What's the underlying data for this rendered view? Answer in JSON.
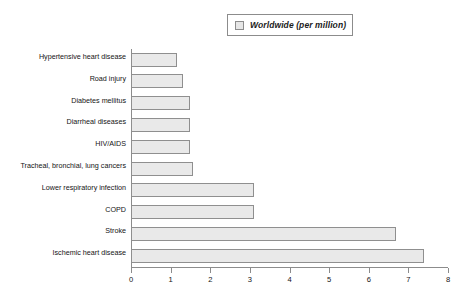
{
  "chart_data": {
    "type": "bar",
    "orientation": "horizontal",
    "title": "",
    "xlabel": "",
    "ylabel": "",
    "xlim": [
      0,
      8
    ],
    "xticks": [
      "0",
      "1",
      "2",
      "3",
      "4",
      "5",
      "6",
      "7",
      "8"
    ],
    "grid": false,
    "legend": {
      "position": "top-right",
      "entries": [
        {
          "label": "Worldwide (per million)",
          "swatch_fill": "#e6e6e6",
          "swatch_border": "#8c8c8c"
        }
      ]
    },
    "categories": [
      "Hypertensive heart disease",
      "Road injury",
      "Diabetes mellitus",
      "Diarrheal diseases",
      "HIV/AIDS",
      "Tracheal, bronchial, lung cancers",
      "Lower respiratory infection",
      "COPD",
      "Stroke",
      "Ischemic heart disease"
    ],
    "values": [
      1.15,
      1.3,
      1.5,
      1.5,
      1.5,
      1.57,
      3.1,
      3.1,
      6.7,
      7.4
    ],
    "series": [
      {
        "name": "Worldwide (per million)",
        "values": [
          1.15,
          1.3,
          1.5,
          1.5,
          1.5,
          1.57,
          3.1,
          3.1,
          6.7,
          7.4
        ]
      }
    ],
    "colors": {
      "bar_fill": "#e9e9e9",
      "bar_border": "#8f8f8f",
      "axis": "#8c8c8c",
      "text": "#141414",
      "background": "#ffffff"
    }
  }
}
